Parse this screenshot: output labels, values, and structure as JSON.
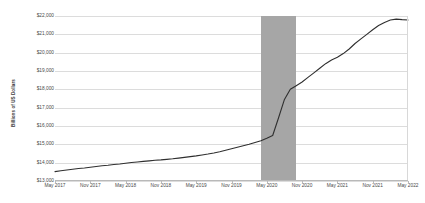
{
  "chart_data": {
    "type": "line",
    "title": "",
    "xlabel": "",
    "ylabel": "Billions of US Dollars",
    "ylim": [
      13000,
      22000
    ],
    "ytick_step": 1000,
    "ytick_labels": [
      "$22,000",
      "$21,000",
      "$20,000",
      "$19,000",
      "$18,000",
      "$17,000",
      "$16,000",
      "$15,000",
      "$14,000",
      "$13,000"
    ],
    "ytick_values": [
      22000,
      21000,
      20000,
      19000,
      18000,
      17000,
      16000,
      15000,
      14000,
      13000
    ],
    "xtick_labels": [
      "May 2017",
      "Nov 2017",
      "May 2018",
      "Nov 2018",
      "May 2019",
      "Nov 2019",
      "May 2020",
      "Nov 2020",
      "May 2021",
      "Nov 2021",
      "May 2022"
    ],
    "grid": true,
    "legend": "none",
    "line_color": "#2f2f2f",
    "line_width": 1.1,
    "recession_band": {
      "label": "recession shading",
      "color": "#a6a6a6",
      "start_x": 35.0,
      "end_x": 41.0
    },
    "x": [
      0,
      1,
      2,
      3,
      4,
      5,
      6,
      7,
      8,
      9,
      10,
      11,
      12,
      13,
      14,
      15,
      16,
      17,
      18,
      19,
      20,
      21,
      22,
      23,
      24,
      25,
      26,
      27,
      28,
      29,
      30,
      31,
      32,
      33,
      34,
      35,
      36,
      37,
      38,
      39,
      40,
      41,
      42,
      43,
      44,
      45,
      46,
      47,
      48,
      49,
      50,
      51,
      52,
      53,
      54,
      55,
      56,
      57,
      58,
      59,
      60
    ],
    "series": [
      {
        "name": "Money supply",
        "values": [
          13510,
          13560,
          13600,
          13640,
          13680,
          13710,
          13750,
          13790,
          13830,
          13860,
          13900,
          13930,
          13970,
          14010,
          14040,
          14070,
          14100,
          14130,
          14150,
          14180,
          14210,
          14250,
          14290,
          14330,
          14370,
          14420,
          14470,
          14530,
          14600,
          14680,
          14760,
          14840,
          14920,
          15000,
          15100,
          15200,
          15330,
          15480,
          16450,
          17450,
          18000,
          18200,
          18400,
          18650,
          18900,
          19150,
          19400,
          19600,
          19750,
          19950,
          20200,
          20500,
          20750,
          21000,
          21250,
          21480,
          21650,
          21780,
          21830,
          21800,
          21780
        ]
      }
    ]
  }
}
